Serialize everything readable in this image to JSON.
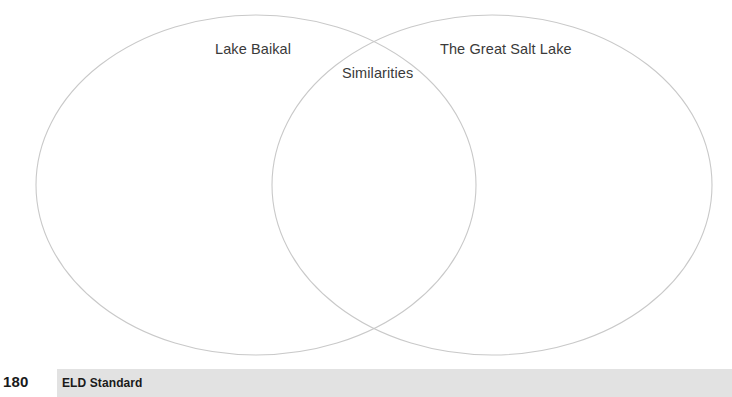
{
  "diagram": {
    "type": "venn",
    "set_count": 2,
    "left_circle": {
      "label": "Lake Baikal",
      "center_x": 256,
      "center_y": 185,
      "radius_x": 220,
      "radius_y": 170
    },
    "right_circle": {
      "label": "The Great Salt Lake",
      "center_x": 492,
      "center_y": 185,
      "radius_x": 220,
      "radius_y": 170
    },
    "overlap": {
      "label": "Similarities"
    },
    "stroke_color": "#c9c9c9",
    "fill_color": "none",
    "text_color": "#3a3a3a"
  },
  "footer": {
    "page_number": "180",
    "standard_label": "ELD Standard",
    "band_color": "#e2e2e2",
    "text_color": "#1a1a1a"
  }
}
